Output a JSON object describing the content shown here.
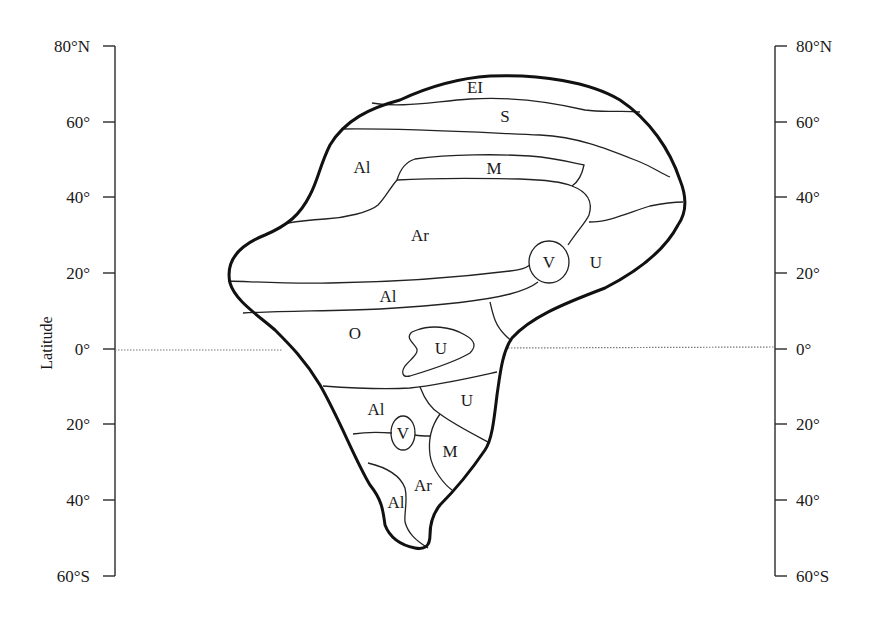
{
  "diagram": {
    "type": "idealized continent climate zones map",
    "axis_title": "Latitude",
    "left_axis": {
      "ticks": [
        {
          "label": "80°N",
          "lat": 80
        },
        {
          "label": "60°",
          "lat": 60
        },
        {
          "label": "40°",
          "lat": 40
        },
        {
          "label": "20°",
          "lat": 20
        },
        {
          "label": "0°",
          "lat": 0
        },
        {
          "label": "20°",
          "lat": -20
        },
        {
          "label": "40°",
          "lat": -40
        },
        {
          "label": "60°S",
          "lat": -60
        }
      ]
    },
    "right_axis": {
      "ticks": [
        {
          "label": "80°N",
          "lat": 80
        },
        {
          "label": "60°",
          "lat": 60
        },
        {
          "label": "40°",
          "lat": 40
        },
        {
          "label": "20°",
          "lat": 20
        },
        {
          "label": "0°",
          "lat": 0
        },
        {
          "label": "20°",
          "lat": -20
        },
        {
          "label": "40°",
          "lat": -40
        },
        {
          "label": "60°S",
          "lat": -60
        }
      ]
    },
    "equator_line": "dotted",
    "regions": [
      {
        "label": "EI",
        "position": "northern cap"
      },
      {
        "label": "S",
        "position": "high-latitude band"
      },
      {
        "label": "Al",
        "position": "north-west mid-latitudes"
      },
      {
        "label": "M",
        "position": "northern mid-latitude strip"
      },
      {
        "label": "Ar",
        "position": "northern subtropical interior"
      },
      {
        "label": "V",
        "position": "northern east-coast circle"
      },
      {
        "label": "U",
        "position": "northern east coast"
      },
      {
        "label": "Al",
        "position": "northern tropical band"
      },
      {
        "label": "O",
        "position": "equatorial west"
      },
      {
        "label": "U",
        "position": "equatorial interior island"
      },
      {
        "label": "U",
        "position": "southern tropical east"
      },
      {
        "label": "Al",
        "position": "southern tropical west"
      },
      {
        "label": "V",
        "position": "southern small circle"
      },
      {
        "label": "M",
        "position": "southern mid-latitude east"
      },
      {
        "label": "Ar",
        "position": "southern tip interior"
      },
      {
        "label": "Al",
        "position": "southern tip west"
      }
    ]
  }
}
